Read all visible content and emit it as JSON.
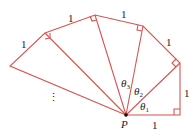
{
  "diagram": {
    "line_color": "#d9534f",
    "point_label": "P",
    "side_labels": [
      "1",
      "1",
      "1",
      "1",
      "1",
      "1"
    ],
    "angle_labels": [
      {
        "sym": "θ",
        "sub": "1"
      },
      {
        "sym": "θ",
        "sub": "2"
      },
      {
        "sym": "θ",
        "sub": "3"
      }
    ],
    "ellipsis": "⋮"
  }
}
